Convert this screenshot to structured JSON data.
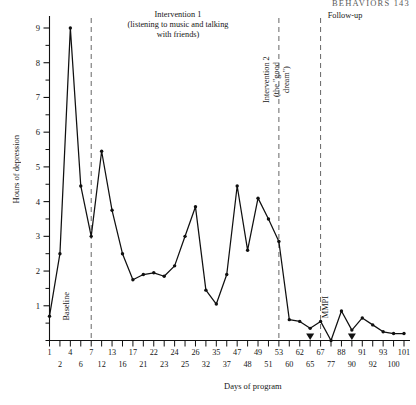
{
  "running_head": "BEHAVIORS     143",
  "chart_data": {
    "type": "line",
    "title": "",
    "xlabel": "Days of program",
    "ylabel": "Hours of depression",
    "ylim": [
      0,
      9.4
    ],
    "yticks": [
      1,
      2,
      3,
      4,
      5,
      6,
      7,
      8,
      9
    ],
    "ytick_labels": [
      "1",
      "2",
      "3",
      "4",
      "5",
      "6",
      "7",
      "8",
      "9"
    ],
    "minor_yticks": [
      0.5,
      1.5,
      2.5,
      3.5,
      4.5,
      5.5,
      6.5,
      7.5,
      8.5
    ],
    "grid": false,
    "legend": "none",
    "xtick_labels_upper": [
      "1",
      "4",
      "7",
      "13",
      "17",
      "22",
      "24",
      "26",
      "35",
      "47",
      "49",
      "53",
      "62",
      "67",
      "88",
      "91",
      "93",
      "101"
    ],
    "xtick_labels_lower": [
      "2",
      "6",
      "12",
      "16",
      "21",
      "23",
      "25",
      "32",
      "37",
      "48",
      "51",
      "60",
      "65",
      "77",
      "90",
      "92",
      "100"
    ],
    "x": [
      1,
      2,
      4,
      6,
      7,
      12,
      13,
      16,
      17,
      21,
      22,
      23,
      24,
      25,
      26,
      32,
      35,
      37,
      47,
      48,
      49,
      51,
      53,
      60,
      62,
      65,
      67,
      77,
      88,
      90,
      91,
      92,
      93,
      100,
      101
    ],
    "values": [
      0.7,
      2.5,
      9.0,
      4.45,
      3.0,
      5.45,
      3.75,
      2.5,
      1.75,
      1.9,
      1.95,
      1.85,
      2.15,
      3.0,
      3.85,
      1.45,
      1.05,
      1.9,
      4.45,
      2.6,
      4.1,
      3.5,
      2.85,
      0.6,
      0.55,
      0.35,
      0.55,
      0.0,
      0.85,
      0.3,
      0.65,
      0.45,
      0.25,
      0.2,
      0.2
    ],
    "markers": "filled-circle",
    "line_color": "#101010",
    "phase_divider_x": [
      7,
      53,
      67
    ],
    "phase_divider_style": "dashed",
    "axis_triangles": [
      65,
      90
    ]
  },
  "phases": [
    {
      "name": "baseline",
      "label": "Baseline",
      "orientation": "vertical"
    },
    {
      "name": "intervention-1",
      "label": "Intervention 1\n(listening to music and talking\nwith friends)",
      "orientation": "horizontal"
    },
    {
      "name": "intervention-2",
      "label": "Intervention 2\n(the “good\ndream”)",
      "orientation": "vertical"
    },
    {
      "name": "follow-up",
      "label": "Follow-up",
      "orientation": "horizontal"
    }
  ],
  "annotations": [
    {
      "name": "mmpi",
      "label": "MMPI",
      "orientation": "vertical"
    }
  ]
}
